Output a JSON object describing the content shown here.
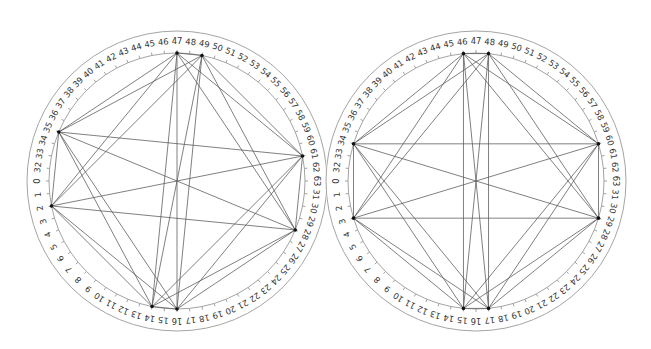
{
  "diagram": {
    "type": "circular-graph",
    "slot_count": 64,
    "slot_order_clockwise_from_left": [
      0,
      32,
      33,
      34,
      35,
      36,
      37,
      38,
      39,
      40,
      41,
      42,
      43,
      44,
      45,
      46,
      47,
      48,
      49,
      50,
      51,
      52,
      53,
      54,
      55,
      56,
      57,
      58,
      59,
      60,
      61,
      62,
      63,
      31,
      30,
      29,
      28,
      27,
      26,
      25,
      24,
      23,
      22,
      21,
      20,
      19,
      18,
      17,
      16,
      15,
      14,
      13,
      12,
      11,
      10,
      9,
      8,
      7,
      6,
      5,
      4,
      3,
      2,
      1
    ],
    "colors": {
      "ring": "#9a9a9a",
      "edge": "#555555",
      "node": "#111111",
      "label": "#333333"
    },
    "panels": [
      {
        "name": "left-circle",
        "center": [
          177,
          181
        ],
        "node_radius": 128,
        "label_radius": 139,
        "outer_radius": 150,
        "nodes": [
          47,
          49,
          35,
          61,
          2,
          28,
          14,
          16
        ],
        "edges": "complete"
      },
      {
        "name": "right-circle",
        "center": [
          476,
          181
        ],
        "node_radius": 128,
        "label_radius": 139,
        "outer_radius": 150,
        "nodes": [
          46,
          48,
          34,
          60,
          3,
          29,
          15,
          17
        ],
        "edges": "complete"
      }
    ]
  }
}
